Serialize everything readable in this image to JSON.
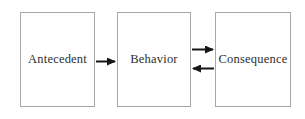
{
  "diagram": {
    "type": "flowchart",
    "nodes": [
      {
        "id": "antecedent",
        "label": "Antecedent"
      },
      {
        "id": "behavior",
        "label": "Behavior"
      },
      {
        "id": "consequence",
        "label": "Consequence"
      }
    ],
    "edges": [
      {
        "from": "antecedent",
        "to": "behavior",
        "direction": "right"
      },
      {
        "from": "behavior",
        "to": "consequence",
        "direction": "right"
      },
      {
        "from": "consequence",
        "to": "behavior",
        "direction": "left"
      }
    ],
    "colors": {
      "background": "#ffffff",
      "box_border": "#a8a8a8",
      "box_fill": "#ffffff",
      "text": "#2e2e2e",
      "arrow": "#161616"
    }
  }
}
